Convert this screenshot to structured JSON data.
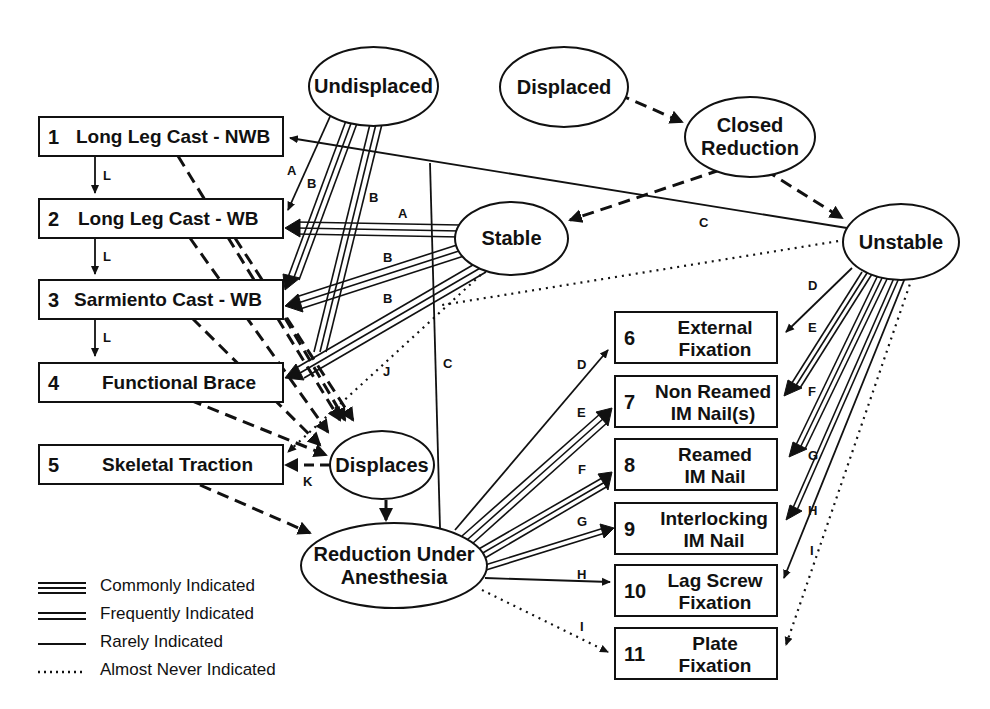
{
  "boxes": [
    {
      "num": "1",
      "label": "Long Leg Cast - NWB"
    },
    {
      "num": "2",
      "label": "Long Leg Cast - WB"
    },
    {
      "num": "3",
      "label": "Sarmiento Cast - WB"
    },
    {
      "num": "4",
      "label": "Functional Brace"
    },
    {
      "num": "5",
      "label": "Skeletal Traction"
    },
    {
      "num": "6",
      "label_line1": "External",
      "label_line2": "Fixation"
    },
    {
      "num": "7",
      "label_line1": "Non Reamed",
      "label_line2": "IM Nail(s)"
    },
    {
      "num": "8",
      "label_line1": "Reamed",
      "label_line2": "IM Nail"
    },
    {
      "num": "9",
      "label_line1": "Interlocking",
      "label_line2": "IM Nail"
    },
    {
      "num": "10",
      "label_line1": "Lag Screw",
      "label_line2": "Fixation"
    },
    {
      "num": "11",
      "label_line1": "Plate",
      "label_line2": "Fixation"
    }
  ],
  "ellipses": {
    "undisplaced": "Undisplaced",
    "displaced": "Displaced",
    "closed_reduction_1": "Closed",
    "closed_reduction_2": "Reduction",
    "stable": "Stable",
    "unstable": "Unstable",
    "displaces": "Displaces",
    "reduction_anesthesia_1": "Reduction Under",
    "reduction_anesthesia_2": "Anesthesia"
  },
  "edge_labels": {
    "L1": "L",
    "L2": "L",
    "L3": "L",
    "A_und": "A",
    "B_und1": "B",
    "B_und2": "B",
    "A_stable": "A",
    "B_stable1": "B",
    "B_stable2": "B",
    "C_top": "C",
    "C_mid": "C",
    "J": "J",
    "K": "K",
    "D_left": "D",
    "E_left": "E",
    "F_left": "F",
    "G_left": "G",
    "H_left": "H",
    "I_left": "I",
    "D_right": "D",
    "E_right": "E",
    "F_right": "F",
    "G_right": "G",
    "H_right": "H",
    "I_right": "I"
  },
  "legend": [
    {
      "style": "triple-line",
      "label": "Commonly Indicated"
    },
    {
      "style": "double-line",
      "label": "Frequently Indicated"
    },
    {
      "style": "single-line",
      "label": "Rarely Indicated"
    },
    {
      "style": "dotted-line",
      "label": "Almost Never Indicated"
    }
  ]
}
